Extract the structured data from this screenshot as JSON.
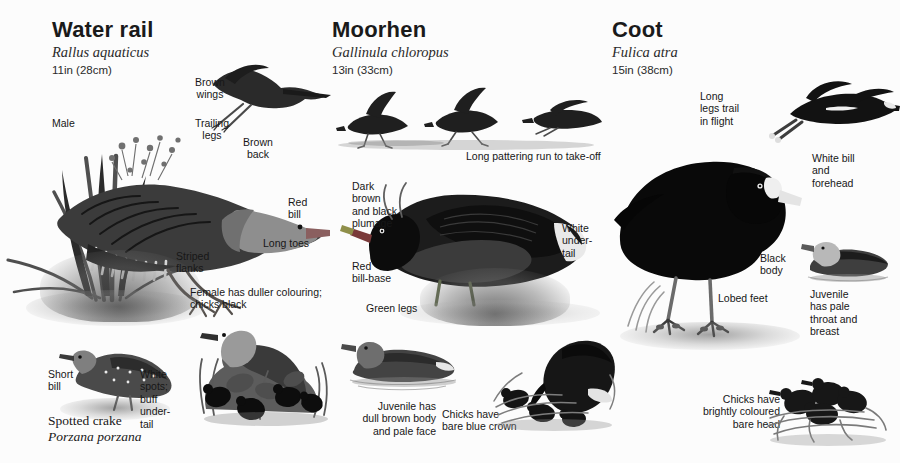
{
  "page": {
    "background_color": "#fcfcfc",
    "text_color": "#171717"
  },
  "species": [
    {
      "id": "water-rail",
      "name": "Water rail",
      "latin": "Rallus aquaticus",
      "size": "11in (28cm)",
      "labels": [
        {
          "id": "brown-wings",
          "text": "Brown\nwings"
        },
        {
          "id": "trailing-legs",
          "text": "Trailing\nlegs"
        },
        {
          "id": "brown-back",
          "text": "Brown\nback"
        },
        {
          "id": "male",
          "text": "Male"
        },
        {
          "id": "red-bill",
          "text": "Red\nbill"
        },
        {
          "id": "long-toes",
          "text": "Long toes"
        },
        {
          "id": "striped-flanks",
          "text": "Striped\nflanks"
        },
        {
          "id": "female-chicks",
          "text": "Female has duller colouring;\nchicks black"
        },
        {
          "id": "short-bill",
          "text": "Short\nbill"
        },
        {
          "id": "white-spots",
          "text": "White\nspots;\nbuff\nunder-\ntail"
        }
      ],
      "subspecies": {
        "name": "Spotted crake",
        "latin": "Porzana porzana"
      }
    },
    {
      "id": "moorhen",
      "name": "Moorhen",
      "latin": "Gallinula chloropus",
      "size": "13in (33cm)",
      "labels": [
        {
          "id": "pattering-run",
          "text": "Long pattering run to take-off"
        },
        {
          "id": "dark-plumage",
          "text": "Dark\nbrown\nand black\nplumage"
        },
        {
          "id": "white-undertail",
          "text": "White\nunder-\ntail"
        },
        {
          "id": "red-bill-base",
          "text": "Red\nbill-base"
        },
        {
          "id": "green-legs",
          "text": "Green legs"
        },
        {
          "id": "juvenile",
          "text": "Juvenile has\ndull brown body\nand pale face"
        },
        {
          "id": "chicks-crown",
          "text": "Chicks have\nbare blue crown"
        }
      ]
    },
    {
      "id": "coot",
      "name": "Coot",
      "latin": "Fulica atra",
      "size": "15in (38cm)",
      "labels": [
        {
          "id": "legs-trail",
          "text": "Long\nlegs trail\nin flight"
        },
        {
          "id": "white-bill",
          "text": "White bill\nand\nforehead"
        },
        {
          "id": "black-body",
          "text": "Black\nbody"
        },
        {
          "id": "lobed-feet",
          "text": "Lobed feet"
        },
        {
          "id": "juvenile-pale",
          "text": "Juvenile\nhas pale\nthroat and\nbreast"
        },
        {
          "id": "chicks-head",
          "text": "Chicks have\nbrightly coloured\nbare head"
        }
      ]
    }
  ]
}
